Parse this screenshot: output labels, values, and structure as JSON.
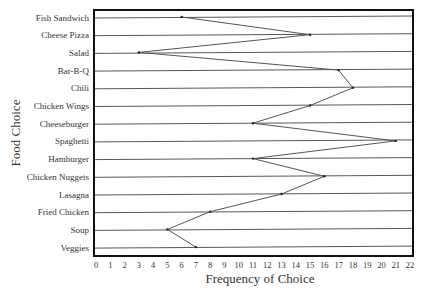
{
  "chart_data": {
    "type": "line",
    "orientation": "horizontal-categories-on-y",
    "title": "",
    "xlabel": "Frequency of Choice",
    "ylabel": "Food Choice",
    "xlim": [
      0,
      22
    ],
    "x_ticks": [
      0,
      1,
      2,
      3,
      4,
      5,
      6,
      7,
      8,
      9,
      10,
      11,
      12,
      13,
      14,
      15,
      16,
      17,
      18,
      19,
      20,
      21,
      22
    ],
    "grid": "horizontal lines per category",
    "legend": null,
    "categories": [
      "Fish Sandwich",
      "Cheese Pizza",
      "Salad",
      "Bar-B-Q",
      "Chili",
      "Chicken Wings",
      "Cheeseburger",
      "Spaghetti",
      "Hamburger",
      "Chicken Nuggets",
      "Lasagna",
      "Fried Chicken",
      "Soup",
      "Veggies"
    ],
    "series": [
      {
        "name": "Frequency",
        "values": [
          6,
          15,
          3,
          17,
          18,
          15,
          11,
          21,
          11,
          16,
          13,
          8,
          5,
          7
        ]
      }
    ]
  },
  "colors": {
    "line": "#555555",
    "frame": "#111111",
    "grid": "#444444",
    "text": "#333333"
  }
}
